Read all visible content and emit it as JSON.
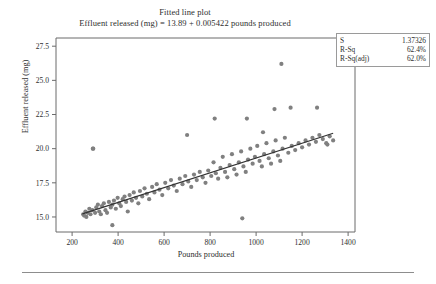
{
  "chart_data": {
    "type": "scatter",
    "title": "Fitted line plot",
    "subtitle": "Effluent released (mg) = 13.89 + 0.005422 pounds produced",
    "xlabel": "Pounds produced",
    "ylabel": "Effluent released (mg)",
    "xlim": [
      130,
      1430
    ],
    "ylim": [
      13.9,
      28.1
    ],
    "xticks": [
      200,
      400,
      600,
      800,
      1000,
      1200,
      1400
    ],
    "yticks": [
      "15.0",
      "17.5",
      "20.0",
      "22.5",
      "25.0",
      "27.5"
    ],
    "ytick_values": [
      15.0,
      17.5,
      20.0,
      22.5,
      25.0,
      27.5
    ],
    "grid": false,
    "legend": "none",
    "point_color": "#808080",
    "line_color": "#333333",
    "fit_line": {
      "intercept": 13.89,
      "slope": 0.005422,
      "x_start": 245,
      "x_end": 1335
    },
    "x": [
      248,
      252,
      258,
      262,
      268,
      275,
      280,
      288,
      292,
      300,
      305,
      312,
      318,
      325,
      330,
      338,
      345,
      352,
      360,
      368,
      375,
      382,
      390,
      398,
      405,
      412,
      420,
      428,
      435,
      442,
      450,
      460,
      468,
      478,
      488,
      495,
      505,
      515,
      525,
      535,
      548,
      558,
      568,
      580,
      592,
      605,
      618,
      630,
      642,
      655,
      668,
      680,
      692,
      705,
      718,
      730,
      742,
      755,
      768,
      780,
      792,
      805,
      815,
      825,
      835,
      845,
      855,
      865,
      875,
      885,
      895,
      905,
      915,
      925,
      935,
      945,
      955,
      965,
      975,
      985,
      995,
      1005,
      1015,
      1025,
      1035,
      1045,
      1055,
      1065,
      1075,
      1085,
      1095,
      1105,
      1115,
      1125,
      1140,
      1155,
      1170,
      1185,
      1200,
      1215,
      1230,
      1245,
      1260,
      1275,
      1290,
      1305,
      1320,
      1335,
      290,
      960,
      1110,
      820,
      700,
      1030,
      1080,
      940,
      1150,
      1265,
      1310,
      375
    ],
    "y": [
      15.2,
      15.1,
      15.4,
      15.0,
      15.3,
      15.6,
      15.2,
      15.5,
      20.0,
      15.3,
      15.7,
      15.9,
      15.4,
      15.2,
      15.8,
      16.0,
      15.5,
      15.3,
      16.1,
      15.7,
      15.9,
      16.2,
      15.6,
      16.4,
      16.0,
      15.8,
      16.3,
      16.5,
      16.1,
      15.4,
      16.6,
      16.2,
      16.8,
      16.4,
      16.0,
      16.9,
      16.5,
      17.1,
      16.7,
      16.3,
      17.2,
      16.8,
      17.4,
      17.0,
      16.6,
      17.5,
      17.1,
      17.7,
      17.3,
      16.9,
      17.8,
      17.4,
      18.0,
      17.6,
      17.2,
      18.1,
      17.7,
      18.3,
      17.9,
      17.5,
      18.4,
      18.0,
      19.0,
      18.2,
      17.8,
      18.6,
      19.4,
      18.3,
      17.9,
      18.8,
      19.6,
      18.5,
      18.1,
      19.0,
      19.8,
      18.7,
      18.3,
      19.2,
      20.0,
      18.9,
      19.4,
      20.2,
      19.1,
      18.7,
      19.6,
      20.4,
      19.3,
      18.9,
      19.8,
      20.6,
      19.5,
      19.1,
      20.0,
      20.8,
      19.7,
      20.2,
      19.9,
      20.4,
      20.1,
      20.6,
      20.3,
      20.8,
      20.5,
      21.0,
      20.7,
      20.4,
      20.9,
      20.6,
      20.0,
      22.2,
      26.2,
      22.2,
      21.0,
      21.2,
      22.9,
      14.9,
      23.0,
      23.0,
      20.3,
      14.4
    ],
    "stats_box": {
      "rows": [
        {
          "label": "S",
          "value": "1.37326"
        },
        {
          "label": "R-Sq",
          "value": "62.4%"
        },
        {
          "label": "R-Sq(adj)",
          "value": "62.0%"
        }
      ]
    }
  }
}
